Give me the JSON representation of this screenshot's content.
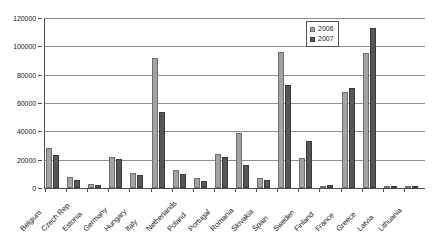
{
  "chart_data": {
    "type": "bar",
    "title": "",
    "subtitle": "",
    "xlabel": "",
    "ylabel": "",
    "ylim": [
      0,
      120000
    ],
    "ytick_labels": [
      "0",
      "20000",
      "40000",
      "60000",
      "80000",
      "100000",
      "120000"
    ],
    "ytick_values": [
      0,
      20000,
      40000,
      60000,
      80000,
      100000,
      120000
    ],
    "grid": true,
    "legend_position": "top-right",
    "categories": [
      "Belgium",
      "Czech Rep",
      "Estonia",
      "Germany",
      "Hungary",
      "Italy",
      "Netherlands",
      "Poland",
      "Portugal",
      "Romania",
      "Slovakia",
      "Spain",
      "Sweden",
      "Finland",
      "France",
      "Greece",
      "Latvia",
      "Lithuania"
    ],
    "series": [
      {
        "name": "2006",
        "color": "#a3a3a3",
        "values": [
          28000,
          8000,
          2500,
          21800,
          10500,
          92000,
          12400,
          7200,
          24000,
          39000,
          6900,
          96000,
          21500,
          1100,
          68000,
          95500,
          400,
          500
        ]
      },
      {
        "name": "2007",
        "color": "#575757",
        "values": [
          23500,
          5500,
          1800,
          20200,
          9200,
          54000,
          9600,
          5100,
          22200,
          16000,
          5900,
          73000,
          33000,
          2200,
          70500,
          113000,
          500,
          1500
        ]
      }
    ]
  },
  "legend": {
    "items": [
      {
        "label": "2006"
      },
      {
        "label": "2007"
      }
    ]
  }
}
